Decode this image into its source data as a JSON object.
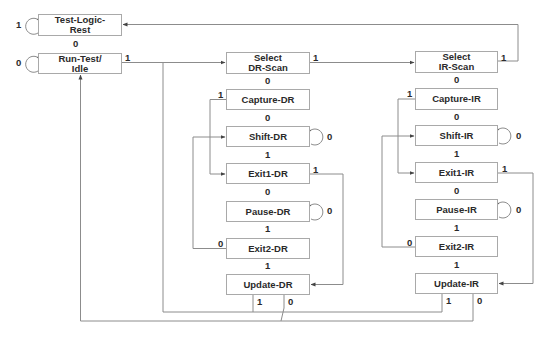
{
  "diagram": {
    "states": {
      "test_logic_reset": {
        "line1": "Test-Logic-",
        "line2": "Rest"
      },
      "run_test_idle": {
        "line1": "Run-Test/",
        "line2": "Idle"
      },
      "select_dr_scan": {
        "line1": "Select",
        "line2": "DR-Scan"
      },
      "capture_dr": {
        "line1": "Capture-DR"
      },
      "shift_dr": {
        "line1": "Shift-DR"
      },
      "exit1_dr": {
        "line1": "Exit1-DR"
      },
      "pause_dr": {
        "line1": "Pause-DR"
      },
      "exit2_dr": {
        "line1": "Exit2-DR"
      },
      "update_dr": {
        "line1": "Update-DR"
      },
      "select_ir_scan": {
        "line1": "Select",
        "line2": "IR-Scan"
      },
      "capture_ir": {
        "line1": "Capture-IR"
      },
      "shift_ir": {
        "line1": "Shift-IR"
      },
      "exit1_ir": {
        "line1": "Exit1-IR"
      },
      "pause_ir": {
        "line1": "Pause-IR"
      },
      "exit2_ir": {
        "line1": "Exit2-IR"
      },
      "update_ir": {
        "line1": "Update-IR"
      }
    },
    "transitions": {
      "tlr_self": "1",
      "tlr_to_rti": "0",
      "rti_self": "0",
      "rti_to_seldr": "1",
      "seldr_to_selir": "1",
      "seldr_to_capdr": "0",
      "capdr_to_exit1dr": "1",
      "capdr_to_shiftdr": "0",
      "shiftdr_self": "0",
      "shiftdr_to_exit1dr": "1",
      "exit1dr_to_updatedr": "1",
      "exit1dr_to_pausedr": "0",
      "pausedr_self": "0",
      "pausedr_to_exit2dr": "1",
      "exit2dr_to_shiftdr": "0",
      "exit2dr_to_updatedr": "1",
      "updatedr_to_seldr": "1",
      "updatedr_to_rti": "0",
      "selir_to_tlr": "1",
      "selir_to_capir": "0",
      "capir_to_exit1ir": "1",
      "capir_to_shiftir": "0",
      "shiftir_self": "0",
      "shiftir_to_exit1ir": "1",
      "exit1ir_to_updateir": "1",
      "exit1ir_to_pauseir": "0",
      "pauseir_self": "0",
      "pauseir_to_exit2ir": "1",
      "exit2ir_to_shiftir": "0",
      "exit2ir_to_updateir": "1",
      "updateir_to_seldr": "1",
      "updateir_to_rti": "0"
    },
    "colors": {
      "line": "#8c8c8c",
      "border": "#a9a9a9",
      "text": "#2a2a2a"
    }
  }
}
